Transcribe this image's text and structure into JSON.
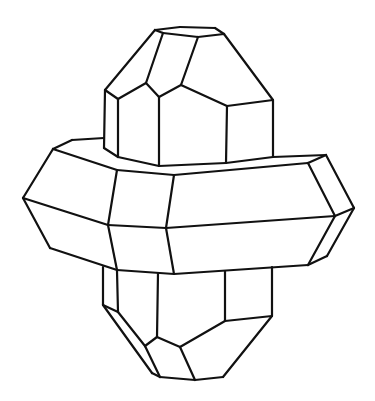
{
  "diagram": {
    "stroke_color": "#111111",
    "background": "#ffffff",
    "parts": [
      "upper-prism",
      "central-band",
      "lower-prism"
    ],
    "lines": [
      [
        155,
        30,
        180,
        27
      ],
      [
        180,
        27,
        215,
        28
      ],
      [
        215,
        28,
        224,
        34
      ],
      [
        155,
        30,
        163,
        33
      ],
      [
        163,
        33,
        198,
        37
      ],
      [
        198,
        37,
        224,
        34
      ],
      [
        155,
        30,
        105,
        90
      ],
      [
        163,
        33,
        146,
        83
      ],
      [
        198,
        37,
        181,
        85
      ],
      [
        224,
        34,
        273,
        100
      ],
      [
        105,
        90,
        118,
        99
      ],
      [
        118,
        99,
        146,
        83
      ],
      [
        146,
        83,
        159,
        97
      ],
      [
        159,
        97,
        181,
        85
      ],
      [
        181,
        85,
        227,
        106
      ],
      [
        227,
        106,
        273,
        100
      ],
      [
        105,
        90,
        104,
        148
      ],
      [
        118,
        99,
        118,
        157
      ],
      [
        159,
        97,
        159,
        166
      ],
      [
        227,
        106,
        226,
        163
      ],
      [
        273,
        100,
        273,
        157
      ],
      [
        104,
        148,
        118,
        157
      ],
      [
        118,
        157,
        159,
        166
      ],
      [
        159,
        166,
        226,
        163
      ],
      [
        226,
        163,
        273,
        157
      ],
      [
        72,
        140,
        104,
        138
      ],
      [
        53,
        149,
        72,
        140
      ],
      [
        53,
        149,
        117,
        170
      ],
      [
        273,
        157,
        326,
        155
      ],
      [
        326,
        155,
        308,
        163
      ],
      [
        117,
        170,
        174,
        175
      ],
      [
        174,
        175,
        308,
        163
      ],
      [
        53,
        149,
        23,
        198
      ],
      [
        326,
        155,
        354,
        208
      ],
      [
        308,
        163,
        335,
        216
      ],
      [
        23,
        198,
        108,
        225
      ],
      [
        108,
        225,
        166,
        228
      ],
      [
        166,
        228,
        335,
        216
      ],
      [
        335,
        216,
        354,
        208
      ],
      [
        117,
        170,
        108,
        225
      ],
      [
        174,
        175,
        166,
        228
      ],
      [
        23,
        198,
        50,
        248
      ],
      [
        50,
        248,
        117,
        270
      ],
      [
        108,
        225,
        117,
        270
      ],
      [
        166,
        228,
        174,
        274
      ],
      [
        117,
        270,
        174,
        274
      ],
      [
        174,
        274,
        308,
        265
      ],
      [
        335,
        216,
        308,
        265
      ],
      [
        354,
        208,
        327,
        256
      ],
      [
        308,
        265,
        327,
        256
      ],
      [
        103,
        267,
        103,
        305
      ],
      [
        117,
        271,
        118,
        312
      ],
      [
        158,
        273,
        157,
        337
      ],
      [
        225,
        271,
        225,
        321
      ],
      [
        272,
        267,
        272,
        316
      ],
      [
        103,
        305,
        118,
        312
      ],
      [
        103,
        305,
        152,
        373
      ],
      [
        152,
        373,
        160,
        377
      ],
      [
        118,
        312,
        145,
        346
      ],
      [
        145,
        346,
        160,
        377
      ],
      [
        145,
        346,
        157,
        337
      ],
      [
        157,
        337,
        180,
        347
      ],
      [
        180,
        347,
        225,
        321
      ],
      [
        180,
        347,
        195,
        380
      ],
      [
        160,
        377,
        195,
        380
      ],
      [
        195,
        380,
        223,
        377
      ],
      [
        223,
        377,
        272,
        316
      ],
      [
        225,
        321,
        272,
        316
      ]
    ]
  }
}
